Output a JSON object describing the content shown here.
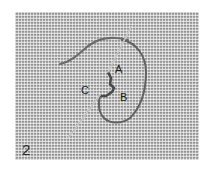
{
  "figure": {
    "number": "2",
    "labels": {
      "a": "A",
      "b": "B",
      "c": "C"
    },
    "colors": {
      "canvas": "#a9a9a9",
      "thread": "#6e6e6e",
      "needle": "#d8d8d8",
      "text": "#1e1e1e"
    }
  }
}
